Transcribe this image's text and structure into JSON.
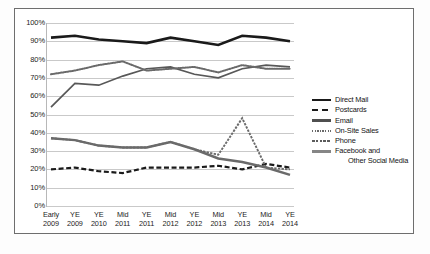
{
  "chart_data": {
    "type": "line",
    "title": "",
    "subtitle": "",
    "xlabel": "",
    "ylabel": "",
    "ylim": [
      0,
      100
    ],
    "yticks": [
      "0%",
      "10%",
      "20%",
      "30%",
      "40%",
      "50%",
      "60%",
      "70%",
      "80%",
      "90%",
      "100%"
    ],
    "ytick_values": [
      0,
      10,
      20,
      30,
      40,
      50,
      60,
      70,
      80,
      90,
      100
    ],
    "grid": "horizontal",
    "legend_position": "right",
    "categories": [
      "Early 2009",
      "YE 2009",
      "YE 2010",
      "Mid 2011",
      "YE 2011",
      "Mid 2012",
      "YE 2012",
      "Mid 2013",
      "YE 2013",
      "Mid 2014",
      "YE 2014"
    ],
    "category_lines": [
      [
        "Early",
        "2009"
      ],
      [
        "YE",
        "2009"
      ],
      [
        "YE",
        "2010"
      ],
      [
        "Mid",
        "2011"
      ],
      [
        "YE",
        "2011"
      ],
      [
        "Mid",
        "2012"
      ],
      [
        "YE",
        "2012"
      ],
      [
        "Mid",
        "2013"
      ],
      [
        "YE",
        "2013"
      ],
      [
        "Mid",
        "2014"
      ],
      [
        "YE",
        "2014"
      ]
    ],
    "series": [
      {
        "name": "Direct Mail",
        "style": "solid-thick",
        "color": "#1a1a1a",
        "values": [
          92,
          93,
          91,
          90,
          89,
          92,
          90,
          88,
          93,
          92,
          90
        ]
      },
      {
        "name": "Postcards",
        "style": "dashed",
        "color": "#1a1a1a",
        "values": [
          20,
          21,
          19,
          18,
          21,
          21,
          21,
          22,
          20,
          23,
          21
        ]
      },
      {
        "name": "Email",
        "style": "solid-medium",
        "color": "#585858",
        "values": [
          54,
          67,
          66,
          71,
          75,
          76,
          72,
          70,
          75,
          77,
          76
        ]
      },
      {
        "name": "On-Site Sales",
        "style": "dotted-bead",
        "color": "#6a6a6a",
        "values": [
          72,
          74,
          77,
          79,
          74,
          75,
          76,
          73,
          77,
          75,
          75
        ]
      },
      {
        "name": "Phone",
        "style": "dash-dot",
        "color": "#6a6a6a",
        "values": [
          37,
          36,
          33,
          32,
          32,
          35,
          31,
          28,
          48,
          21,
          20
        ]
      },
      {
        "name": "Facebook and Other Social Media",
        "style": "solid-thick-gray",
        "color": "#6a6a6a",
        "values": [
          37,
          36,
          33,
          32,
          32,
          35,
          31,
          26,
          24,
          21,
          17
        ]
      }
    ]
  },
  "legend": {
    "items": [
      {
        "label": "Direct Mail",
        "label2": "",
        "swatch": "solid-thick-black"
      },
      {
        "label": "Postcards",
        "label2": "",
        "swatch": "dashed-black"
      },
      {
        "label": "Email",
        "label2": "",
        "swatch": "solid-medium-gray"
      },
      {
        "label": "On-Site Sales",
        "label2": "",
        "swatch": "dotted-bead-gray"
      },
      {
        "label": "Phone",
        "label2": "",
        "swatch": "dash-dot-gray"
      },
      {
        "label": "Facebook and",
        "label2": "Other Social Media",
        "swatch": "solid-thick-gray"
      }
    ]
  },
  "colors": {
    "black": "#1a1a1a",
    "dark_gray": "#585858",
    "gray": "#6a6a6a",
    "gridline": "#c9c9c9",
    "frame": "#6e6e6e",
    "background": "#ffffff"
  }
}
